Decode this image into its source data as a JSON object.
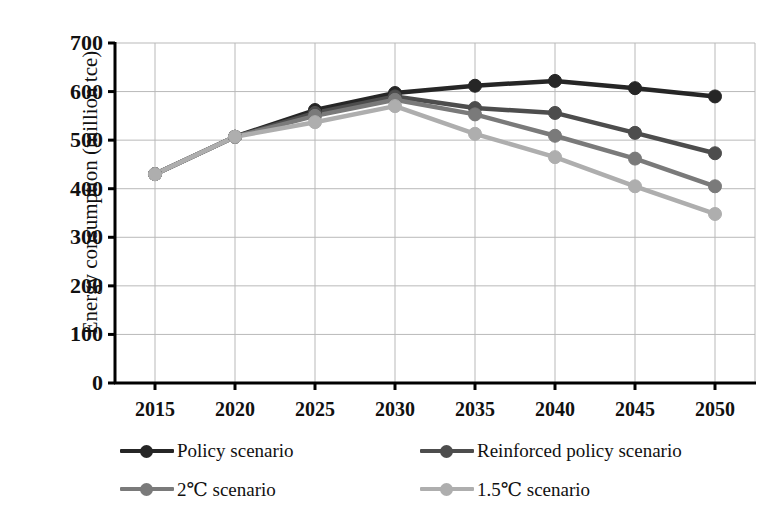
{
  "chart_data": {
    "type": "line",
    "title": "",
    "xlabel": "",
    "ylabel": "Energy consumption (million tce)",
    "x": [
      2015,
      2020,
      2025,
      2030,
      2035,
      2040,
      2045,
      2050
    ],
    "xtick_labels": [
      "2015",
      "2020",
      "2025",
      "2030",
      "2035",
      "2040",
      "2045",
      "2050"
    ],
    "ytick_labels": [
      "0",
      "100",
      "200",
      "300",
      "400",
      "500",
      "600",
      "700"
    ],
    "yticks": [
      0,
      100,
      200,
      300,
      400,
      500,
      600,
      700
    ],
    "ylim": [
      0,
      700
    ],
    "xlim": [
      2012.5,
      2052.5
    ],
    "grid": true,
    "grid_color": "#b9b9b9",
    "axis_color": "#000000",
    "legend_position": "bottom",
    "marker": "circle",
    "series": [
      {
        "name": "Policy scenario",
        "color": "#262626",
        "values": [
          430,
          507,
          562,
          597,
          612,
          622,
          607,
          590
        ]
      },
      {
        "name": "Reinforced policy scenario",
        "color": "#4d4d4d",
        "values": [
          430,
          507,
          556,
          590,
          566,
          556,
          515,
          473
        ]
      },
      {
        "name": "2℃ scenario",
        "color": "#7a7a7a",
        "values": [
          430,
          507,
          550,
          583,
          553,
          509,
          462,
          405
        ]
      },
      {
        "name": "1.5℃ scenario",
        "color": "#aeaeae",
        "values": [
          430,
          507,
          537,
          570,
          513,
          465,
          405,
          348
        ]
      }
    ]
  },
  "legend": {
    "items": [
      {
        "label": "Policy scenario",
        "color": "#262626"
      },
      {
        "label": "Reinforced policy scenario",
        "color": "#4d4d4d"
      },
      {
        "label": "2℃ scenario",
        "color": "#7a7a7a"
      },
      {
        "label": "1.5℃ scenario",
        "color": "#aeaeae"
      }
    ]
  }
}
